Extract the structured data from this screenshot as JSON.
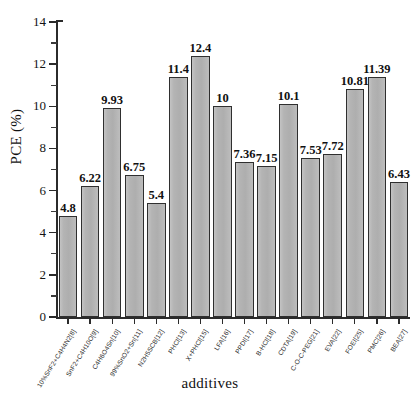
{
  "chart_data": {
    "type": "bar",
    "title": "",
    "xlabel": "additives",
    "ylabel": "PCE (%)",
    "ylim": [
      0,
      14
    ],
    "ytick_values": [
      0,
      2,
      4,
      6,
      8,
      10,
      12,
      14
    ],
    "ytick_labels": [
      "0",
      "2",
      "4",
      "6",
      "8",
      "10",
      "12",
      "14"
    ],
    "y_minor_step": 1,
    "grid": false,
    "legend": null,
    "bar_color": "#b4b4b4",
    "bar_edge_color": "#2f2f2f",
    "categories": [
      "10%SnF2+C4H4N2[8]",
      "SnF2+C4H10O[9]",
      "C4H6O4Sn[10]",
      "99%SnO2+Sn[11]",
      "N2H5SCB[12]",
      "PHCl[13]",
      "X+PHCl[15]",
      "LFA[16]",
      "PPDI[17]",
      "B-HCl[18]",
      "CDTA[19]",
      "C-O-C-PEG[21]",
      "EVA[22]",
      "FOEI[25]",
      "PMC[26]",
      "BEA[27]"
    ],
    "values": [
      4.8,
      6.22,
      9.93,
      6.75,
      5.4,
      11.4,
      12.4,
      10,
      7.36,
      7.15,
      10.1,
      7.53,
      7.72,
      10.81,
      11.39,
      6.43
    ],
    "value_labels": [
      "4.8",
      "6.22",
      "9.93",
      "6.75",
      "5.4",
      "11.4",
      "12.4",
      "10",
      "7.36",
      "7.15",
      "10.1",
      "7.53",
      "7.72",
      "10.81",
      "11.39",
      "6.43"
    ]
  }
}
